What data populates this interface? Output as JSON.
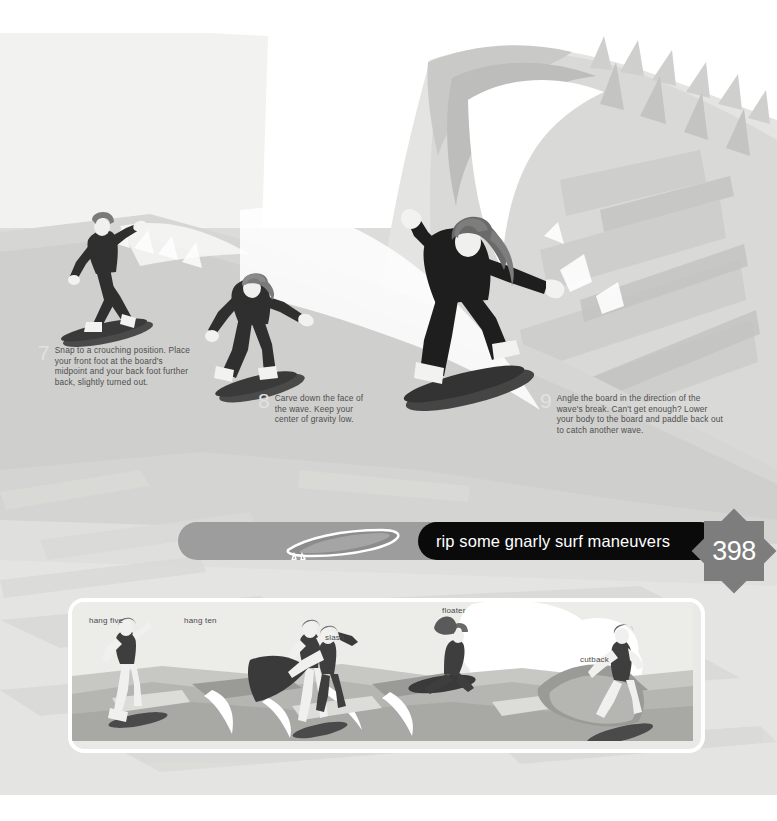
{
  "page": {
    "number": "398",
    "banner_title": "rip some gnarly surf maneuvers"
  },
  "colors": {
    "banner_black": "#0a0a0a",
    "banner_gray": "#9d9d9d",
    "star_gray": "#7d7d7d",
    "wave_light": "#e6e6e4",
    "wave_mid": "#d2d2d0",
    "wave_dark": "#bcbcba",
    "surfer_dark": "#2f2f2f",
    "text_body": "#4e4e4e",
    "step_number": "#e2e2e0",
    "page_background": "#ffffff",
    "strip_background": "#e9e9e7"
  },
  "steps": [
    {
      "number": "7",
      "text": "Snap to a crouching position. Place your front foot at the board's midpoint and your back foot further back, slightly turned out."
    },
    {
      "number": "8",
      "text": "Carve down the face of the wave. Keep your center of gravity low."
    },
    {
      "number": "9",
      "text": "Angle the board in the direction of the wave's break. Can't get enough? Lower your body to the board and paddle back out to catch another wave."
    }
  ],
  "maneuver_strip": {
    "labels": [
      "hang five",
      "hang ten",
      "slash",
      "floater",
      "cutback"
    ]
  },
  "icons": {
    "surfboard": "surfboard-icon",
    "star_burst": "star-burst-icon"
  }
}
